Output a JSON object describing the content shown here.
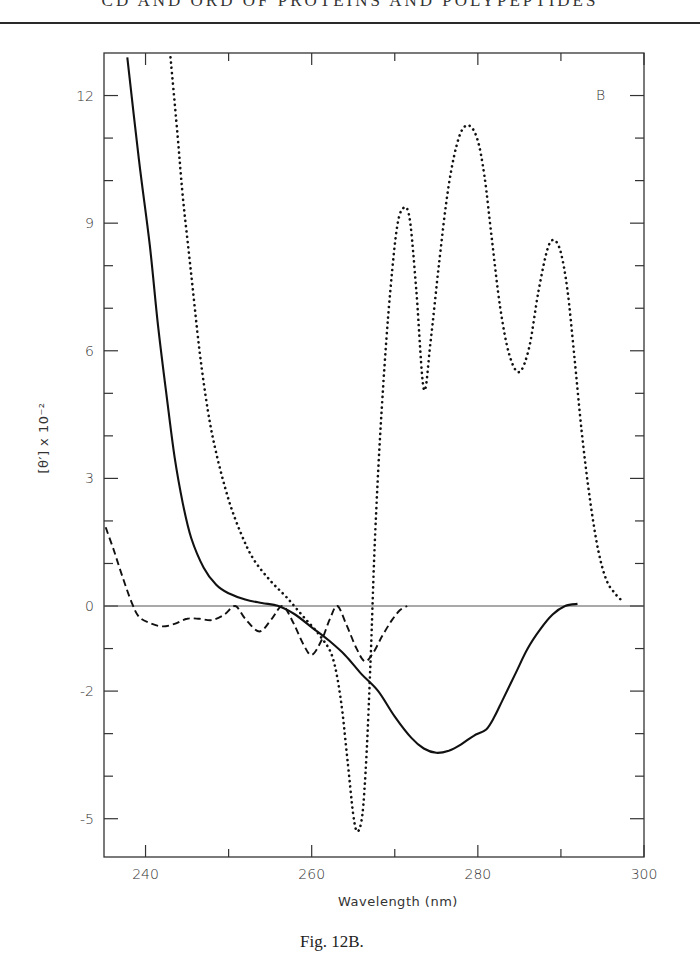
{
  "page": {
    "running_head": "CD AND ORD OF PROTEINS AND POLYPEPTIDES",
    "caption": "Fig. 12B."
  },
  "chart_data": {
    "type": "line",
    "title": "",
    "panel_label": "B",
    "xlabel": "Wavelength (nm)",
    "ylabel": "[θ′] x 10⁻²",
    "xlim": [
      235,
      300
    ],
    "ylim": [
      -5.9,
      13
    ],
    "x_ticks": [
      240,
      250,
      260,
      270,
      280,
      290,
      300
    ],
    "x_tick_labels": [
      "240",
      "",
      "260",
      "",
      "280",
      "",
      "300"
    ],
    "y_ticks": [
      -5,
      -4,
      -3,
      -2,
      -1,
      0,
      1,
      2,
      3,
      4,
      5,
      6,
      7,
      8,
      9,
      10,
      11,
      12
    ],
    "y_tick_labels": {
      "-5": "-5",
      "-2": "-2",
      "0": "0",
      "3": "3",
      "6": "6",
      "9": "9",
      "12": "12"
    },
    "grid": false,
    "zero_line": true,
    "legend": "none",
    "series": [
      {
        "name": "solid",
        "style": "solid",
        "points": [
          [
            237.8,
            12.9
          ],
          [
            239.2,
            10.5
          ],
          [
            240.5,
            8.5
          ],
          [
            241.5,
            6.6
          ],
          [
            242.5,
            5.0
          ],
          [
            243.5,
            3.5
          ],
          [
            244.5,
            2.4
          ],
          [
            245.5,
            1.6
          ],
          [
            247,
            0.9
          ],
          [
            248.5,
            0.5
          ],
          [
            250,
            0.3
          ],
          [
            252,
            0.15
          ],
          [
            254,
            0.07
          ],
          [
            256,
            0.0
          ],
          [
            258,
            -0.2
          ],
          [
            260,
            -0.5
          ],
          [
            262,
            -0.8
          ],
          [
            264,
            -1.15
          ],
          [
            266,
            -1.6
          ],
          [
            268,
            -2.0
          ],
          [
            270,
            -2.6
          ],
          [
            272,
            -3.1
          ],
          [
            273.5,
            -3.35
          ],
          [
            275,
            -3.45
          ],
          [
            276.5,
            -3.4
          ],
          [
            278,
            -3.25
          ],
          [
            279.5,
            -3.05
          ],
          [
            281,
            -2.9
          ],
          [
            282,
            -2.6
          ],
          [
            283,
            -2.2
          ],
          [
            284.5,
            -1.6
          ],
          [
            286,
            -1.0
          ],
          [
            287.5,
            -0.55
          ],
          [
            289,
            -0.2
          ],
          [
            290.5,
            0.0
          ],
          [
            292,
            0.05
          ]
        ]
      },
      {
        "name": "dotted",
        "style": "dotted",
        "points": [
          [
            243,
            12.9
          ],
          [
            243.8,
            11.2
          ],
          [
            244.5,
            9.6
          ],
          [
            245.5,
            7.8
          ],
          [
            246.5,
            6.0
          ],
          [
            247.5,
            4.6
          ],
          [
            248.5,
            3.6
          ],
          [
            250,
            2.5
          ],
          [
            251.5,
            1.7
          ],
          [
            253,
            1.1
          ],
          [
            255,
            0.6
          ],
          [
            257,
            0.2
          ],
          [
            259,
            -0.25
          ],
          [
            261,
            -0.7
          ],
          [
            262.5,
            -1.2
          ],
          [
            263.5,
            -2.2
          ],
          [
            264.3,
            -3.6
          ],
          [
            265,
            -4.9
          ],
          [
            265.5,
            -5.3
          ],
          [
            266.1,
            -4.9
          ],
          [
            266.6,
            -3.5
          ],
          [
            267.1,
            -1.2
          ],
          [
            267.6,
            1.5
          ],
          [
            268.3,
            4.2
          ],
          [
            269.2,
            6.8
          ],
          [
            270.2,
            8.8
          ],
          [
            271,
            9.35
          ],
          [
            271.8,
            9.1
          ],
          [
            272.6,
            7.4
          ],
          [
            273.5,
            5.1
          ],
          [
            274.3,
            6.2
          ],
          [
            275.3,
            8.0
          ],
          [
            276.5,
            9.9
          ],
          [
            277.7,
            11.0
          ],
          [
            278.8,
            11.3
          ],
          [
            279.9,
            11.0
          ],
          [
            280.8,
            10.1
          ],
          [
            281.7,
            8.6
          ],
          [
            282.7,
            7.0
          ],
          [
            283.8,
            5.9
          ],
          [
            285,
            5.5
          ],
          [
            286.2,
            6.1
          ],
          [
            287.3,
            7.4
          ],
          [
            288.4,
            8.4
          ],
          [
            289.2,
            8.6
          ],
          [
            290,
            8.3
          ],
          [
            290.8,
            7.4
          ],
          [
            291.6,
            5.9
          ],
          [
            292.5,
            4.1
          ],
          [
            293.5,
            2.5
          ],
          [
            294.5,
            1.3
          ],
          [
            295.5,
            0.6
          ],
          [
            296.5,
            0.3
          ],
          [
            297.2,
            0.15
          ]
        ]
      },
      {
        "name": "dashed",
        "style": "dashed",
        "points": [
          [
            235.2,
            1.85
          ],
          [
            236.2,
            1.3
          ],
          [
            237.2,
            0.7
          ],
          [
            238.3,
            0.1
          ],
          [
            239.2,
            -0.25
          ],
          [
            240.5,
            -0.4
          ],
          [
            242,
            -0.48
          ],
          [
            243.5,
            -0.42
          ],
          [
            245,
            -0.3
          ],
          [
            246.5,
            -0.3
          ],
          [
            248,
            -0.33
          ],
          [
            249.5,
            -0.2
          ],
          [
            250.8,
            0.0
          ],
          [
            252,
            -0.3
          ],
          [
            253.7,
            -0.6
          ],
          [
            255.2,
            -0.3
          ],
          [
            256.5,
            0.0
          ],
          [
            257.8,
            -0.4
          ],
          [
            259,
            -0.9
          ],
          [
            260,
            -1.15
          ],
          [
            261.2,
            -0.8
          ],
          [
            262.2,
            -0.3
          ],
          [
            263.1,
            0.0
          ],
          [
            264.2,
            -0.45
          ],
          [
            265.4,
            -1.0
          ],
          [
            266.4,
            -1.3
          ],
          [
            267.4,
            -1.1
          ],
          [
            268.5,
            -0.7
          ],
          [
            269.6,
            -0.35
          ],
          [
            270.6,
            -0.1
          ],
          [
            271.5,
            0.0
          ]
        ]
      }
    ]
  }
}
